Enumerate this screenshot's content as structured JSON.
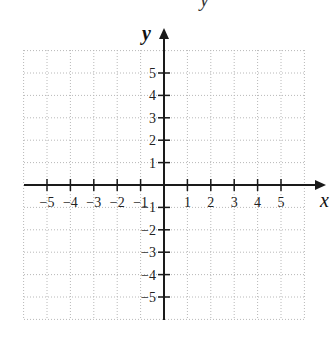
{
  "header_fragment": "y",
  "chart_data": {
    "type": "scatter",
    "title": "",
    "subtitle": "",
    "xlabel": "x",
    "ylabel": "y",
    "xlim": [
      -6,
      6
    ],
    "ylim": [
      -6,
      6
    ],
    "grid": true,
    "grid_style": "dotted",
    "x_ticks": [
      -5,
      -4,
      -3,
      -2,
      -1,
      1,
      2,
      3,
      4,
      5
    ],
    "y_ticks": [
      5,
      4,
      3,
      2,
      1,
      -1,
      -2,
      -3,
      -4,
      -5
    ],
    "x_tick_labels": [
      "−5",
      "−4",
      "−3",
      "−2",
      "−1",
      "1",
      "2",
      "3",
      "4",
      "5"
    ],
    "y_tick_labels": [
      "5",
      "4",
      "3",
      "2",
      "1",
      "−1",
      "−2",
      "−3",
      "−4",
      "−5"
    ],
    "series": [],
    "legend": null
  },
  "layout": {
    "origin_px": [
      164,
      185
    ],
    "unit_x_px": 23.4,
    "unit_y_px": 22.4,
    "grid_left": 24,
    "grid_right": 305,
    "grid_top": 50,
    "grid_bottom": 319,
    "x_axis_arrow_tip": 326,
    "y_axis_arrow_tip": 28,
    "y_axis_bottom": 320
  },
  "colors": {
    "axis": "#1a1a1a",
    "grid": "#b8b8b8",
    "text": "#222222",
    "background": "#ffffff"
  }
}
